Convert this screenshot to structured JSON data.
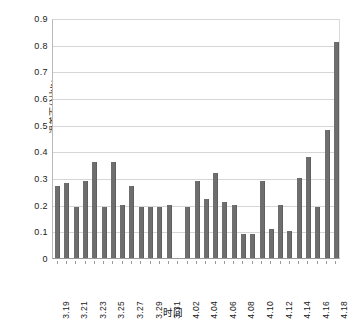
{
  "chart_data": {
    "type": "bar",
    "title": "",
    "subtitle": "",
    "xlabel": "时间",
    "ylabel": "误差百分比/%",
    "ylim": [
      0,
      0.9
    ],
    "ytick_values": [
      0,
      0.1,
      0.2,
      0.3,
      0.4,
      0.5,
      0.6,
      0.7,
      0.8,
      0.9
    ],
    "ytick_labels": [
      "0",
      "0.1",
      "0.2",
      "0.3",
      "0.4",
      "0.5",
      "0.6",
      "0.7",
      "0.8",
      "0.9"
    ],
    "grid": "horizontal",
    "legend": "none",
    "bar_color": "#6e6e6e",
    "categories": [
      "3.19",
      "3.20",
      "3.21",
      "3.22",
      "3.23",
      "3.24",
      "3.25",
      "3.26",
      "3.27",
      "3.28",
      "3.29",
      "3.30",
      "3.31",
      "4.01",
      "4.02",
      "4.03",
      "4.04",
      "4.05",
      "4.06",
      "4.07",
      "4.08",
      "4.09",
      "4.10",
      "4.11",
      "4.12",
      "4.13",
      "4.14",
      "4.15",
      "4.16",
      "4.17",
      "4.18"
    ],
    "xtick_labels": [
      "3.19",
      "3.21",
      "3.23",
      "3.25",
      "3.27",
      "3.29",
      "3.31",
      "4.02",
      "4.04",
      "4.06",
      "4.08",
      "4.10",
      "4.12",
      "4.14",
      "4.16",
      "4.18"
    ],
    "values": [
      0.27,
      0.28,
      0.19,
      0.29,
      0.36,
      0.19,
      0.36,
      0.2,
      0.27,
      0.19,
      0.19,
      0.19,
      0.2,
      null,
      0.19,
      0.29,
      0.22,
      0.32,
      0.21,
      0.2,
      0.09,
      0.09,
      0.29,
      0.11,
      0.2,
      0.1,
      0.3,
      0.38,
      0.19,
      0.48,
      0.81
    ],
    "missing_categories": [
      "4.01"
    ]
  }
}
